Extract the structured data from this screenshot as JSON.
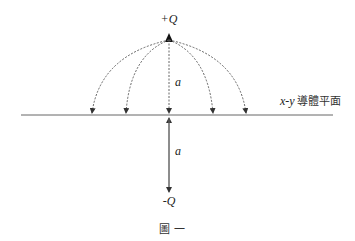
{
  "figure": {
    "charge_top": "+Q",
    "charge_bottom": "-Q",
    "distance_top": "a",
    "distance_bottom": "a",
    "plane_label_var": "x-y",
    "plane_label_text": "導體平面",
    "caption": "圖 一"
  },
  "colors": {
    "line": "#555555",
    "text": "#222222"
  }
}
